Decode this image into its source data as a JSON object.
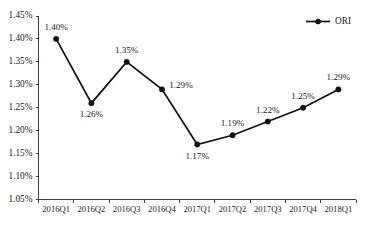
{
  "chart_data": {
    "type": "line",
    "title": "",
    "subtitle": "",
    "xlabel": "",
    "ylabel": "",
    "categories": [
      "2016Q1",
      "2016Q2",
      "2016Q3",
      "2016Q4",
      "2017Q1",
      "2017Q2",
      "2017Q3",
      "2017Q4",
      "2018Q1"
    ],
    "values": [
      1.4,
      1.26,
      1.35,
      1.29,
      1.17,
      1.19,
      1.22,
      1.25,
      1.29
    ],
    "point_labels": [
      "1.40%",
      "1.26%",
      "1.35%",
      "1.29%",
      "1.17%",
      "1.19%",
      "1.22%",
      "1.25%",
      "1.29%"
    ],
    "label_positions": [
      "above",
      "below",
      "above",
      "right",
      "below",
      "above",
      "above",
      "above",
      "above"
    ],
    "series": [
      {
        "name": "ORI",
        "values": [
          1.4,
          1.26,
          1.35,
          1.29,
          1.17,
          1.19,
          1.22,
          1.25,
          1.29
        ],
        "color": "#111111",
        "marker": "circle"
      }
    ],
    "ylim": [
      1.05,
      1.45
    ],
    "ytick_values": [
      1.45,
      1.4,
      1.35,
      1.3,
      1.25,
      1.2,
      1.15,
      1.1,
      1.05
    ],
    "ytick_labels": [
      "1.45%",
      "1.40%",
      "1.35%",
      "1.30%",
      "1.25%",
      "1.20%",
      "1.15%",
      "1.10%",
      "1.05%"
    ],
    "grid": false,
    "legend": {
      "position": "top-right",
      "entries": [
        {
          "label": "ORI",
          "color": "#111111",
          "marker": "circle"
        }
      ]
    },
    "axis_color": "#2b2b2b",
    "background_color": "#ffffff"
  }
}
